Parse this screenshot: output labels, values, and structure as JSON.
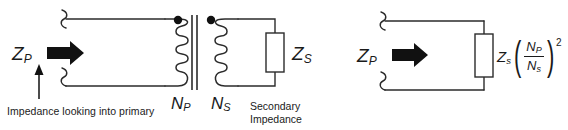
{
  "figure": {
    "background_color": "#ffffff",
    "line_color": "#2b2b2b",
    "ink_color": "#111111"
  },
  "left_circuit": {
    "name": "transformer-with-secondary-load",
    "primary_impedance_label": "Z",
    "primary_impedance_sub": "P",
    "secondary_impedance_label": "Z",
    "secondary_impedance_sub": "S",
    "primary_turns_label": "N",
    "primary_turns_sub": "P",
    "secondary_turns_label": "N",
    "secondary_turns_sub": "S",
    "primary_caption": "Impedance looking into primary",
    "secondary_caption_line1": "Secondary",
    "secondary_caption_line2": "Impedance",
    "primary_coil_turns": 4,
    "secondary_coil_turns": 4,
    "polarity_dots": 2,
    "core_lines": 2
  },
  "right_circuit": {
    "name": "reflected-impedance-equivalent",
    "primary_impedance_label": "Z",
    "primary_impedance_sub": "P",
    "load_label": "Z",
    "load_sub": "s",
    "numerator_label": "N",
    "numerator_sub": "P",
    "denominator_label": "N",
    "denominator_sub": "s",
    "exponent": "2",
    "open_paren": "(",
    "close_paren": ")"
  }
}
